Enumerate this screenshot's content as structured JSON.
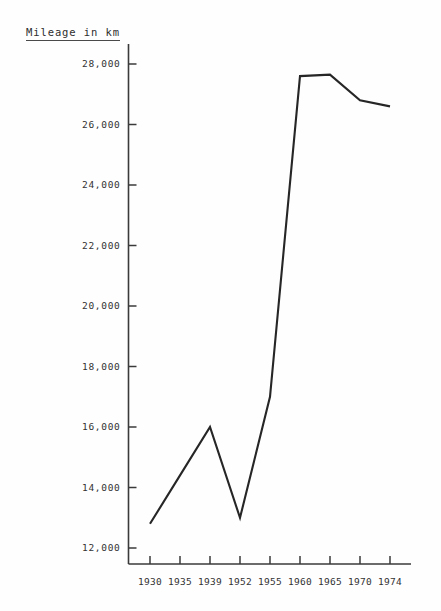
{
  "chart_data": {
    "type": "line",
    "title": "Mileage in km",
    "xlabel": "",
    "ylabel": "Mileage in km",
    "categories": [
      "1930",
      "1935",
      "1939",
      "1952",
      "1955",
      "1960",
      "1965",
      "1970",
      "1974"
    ],
    "values": [
      12800,
      14400,
      16000,
      13000,
      17000,
      27600,
      27650,
      26800,
      26600
    ],
    "series": [
      {
        "name": "Mileage in km",
        "values": [
          12800,
          14400,
          16000,
          13000,
          17000,
          27600,
          27650,
          26800,
          26600
        ]
      }
    ],
    "ylim": [
      12000,
      28600
    ],
    "yticks": [
      12000,
      14000,
      16000,
      18000,
      20000,
      22000,
      24000,
      26000,
      28000
    ],
    "ytick_labels": [
      "12,000",
      "14,000",
      "16,000",
      "18,000",
      "20,000",
      "22,000",
      "24,000",
      "26,000",
      "28,000"
    ],
    "xtick_labels": [
      "1930",
      "1935",
      "1939",
      "1952",
      "1955",
      "1960",
      "1965",
      "1970",
      "1974"
    ],
    "grid": false,
    "legend": false,
    "line_color": "#262626",
    "axis_color": "#3a3a3a",
    "background_color": "#fefefe"
  }
}
